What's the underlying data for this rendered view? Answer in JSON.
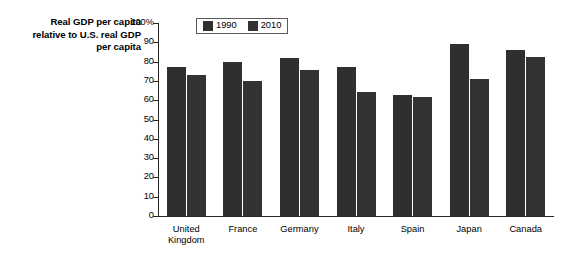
{
  "chart_data": {
    "type": "bar",
    "title": "",
    "axis_title_lines": [
      "Real GDP per capita",
      "relative to U.S. real GDP",
      "per capita"
    ],
    "categories": [
      "United Kingdom",
      "France",
      "Germany",
      "Italy",
      "Spain",
      "Japan",
      "Canada"
    ],
    "category_label_lines": [
      [
        "United",
        "Kingdom"
      ],
      [
        "France"
      ],
      [
        "Germany"
      ],
      [
        "Italy"
      ],
      [
        "Spain"
      ],
      [
        "Japan"
      ],
      [
        "Canada"
      ]
    ],
    "series": [
      {
        "name": "1990",
        "color": "#2f2f2f",
        "values": [
          77,
          80,
          82,
          77,
          62.5,
          89,
          86
        ]
      },
      {
        "name": "2010",
        "color": "#333333",
        "values": [
          73,
          70,
          75.5,
          64,
          61.5,
          71,
          82.5
        ]
      }
    ],
    "xlabel": "",
    "ylabel": "",
    "ylim": [
      0,
      100
    ],
    "yticks": [
      0,
      10,
      20,
      30,
      40,
      50,
      60,
      70,
      80,
      90,
      100
    ],
    "ytick_labels": [
      "0",
      "10",
      "20",
      "30",
      "40",
      "50",
      "60",
      "70",
      "80",
      "90",
      "100%"
    ],
    "grid": false,
    "legend_position": "top-left-inside",
    "legend_entries": [
      "1990",
      "2010"
    ]
  },
  "legend": {
    "items": [
      {
        "label": "1990",
        "color": "#2f2f2f"
      },
      {
        "label": "2010",
        "color": "#333333"
      }
    ]
  }
}
